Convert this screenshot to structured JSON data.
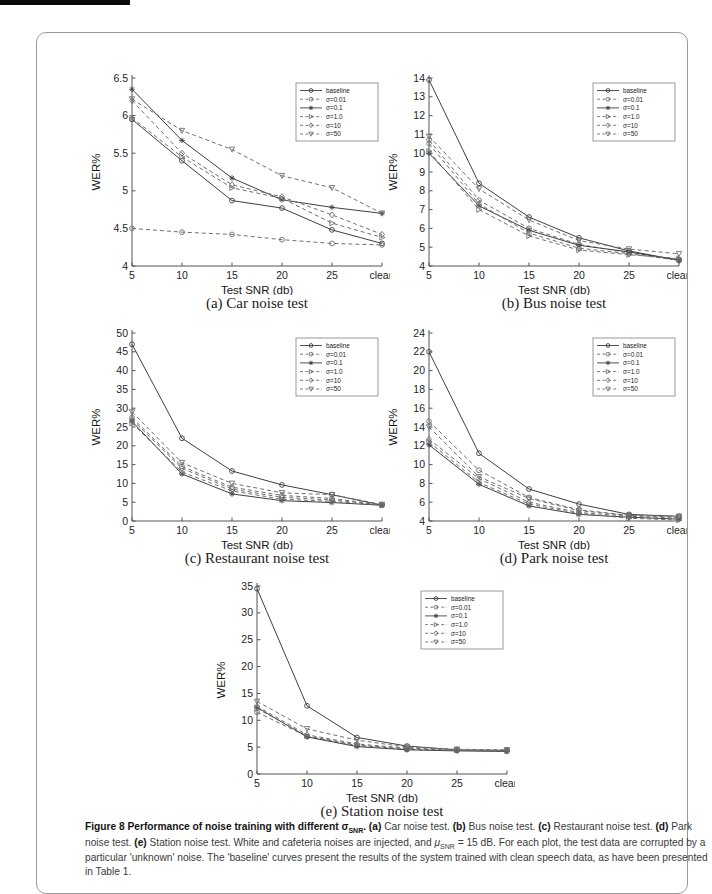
{
  "caption": {
    "segments": [
      {
        "text": "Figure 8 Performance of noise training with different ",
        "bold": true
      },
      {
        "text": "σ",
        "bold": true
      },
      {
        "text": "SNR",
        "bold": true,
        "sub": true
      },
      {
        "text": ". ",
        "bold": true
      },
      {
        "text": "(a)",
        "bold": true
      },
      {
        "text": " Car noise test. "
      },
      {
        "text": "(b)",
        "bold": true
      },
      {
        "text": " Bus noise test. "
      },
      {
        "text": "(c)",
        "bold": true
      },
      {
        "text": " Restaurant noise test. "
      },
      {
        "text": "(d)",
        "bold": true
      },
      {
        "text": " Park noise test. "
      },
      {
        "text": "(e)",
        "bold": true
      },
      {
        "text": " Station noise test. White and cafeteria noises are injected, and "
      },
      {
        "text": "μ",
        "italic": true
      },
      {
        "text": "SNR",
        "sub": true
      },
      {
        "text": " = 15 dB. For each plot, the test data are corrupted by a particular 'unknown' noise. The 'baseline' curves present the results of the system trained with clean speech data, as have been presented in Table 1."
      }
    ]
  },
  "style": {
    "solid_color": "#3f3f3f",
    "dashed_color": "#6f6f6f",
    "axis_color": "#555555",
    "tick_text_color": "#1e1e1e",
    "legend_border_color": "#808080"
  },
  "chart_data": [
    {
      "id": "a",
      "type": "line",
      "caption": "(a) Car noise test",
      "xlabel": "Test SNR (db)",
      "ylabel": "WER%",
      "x_categories": [
        "5",
        "10",
        "15",
        "20",
        "25",
        "clean"
      ],
      "ylim": [
        4,
        6.5
      ],
      "ytick_step": 0.5,
      "grid": false,
      "legend_position": "top-right",
      "series": [
        {
          "name": "baseline",
          "line": "solid",
          "marker": "circle",
          "values": [
            5.95,
            5.4,
            4.87,
            4.77,
            4.48,
            4.3
          ]
        },
        {
          "name": "σ=0.01",
          "line": "dashed",
          "marker": "circle",
          "values": [
            4.5,
            4.45,
            4.42,
            4.35,
            4.3,
            4.28
          ]
        },
        {
          "name": "σ=0.1",
          "line": "solid",
          "marker": "star",
          "values": [
            6.35,
            5.67,
            5.17,
            4.88,
            4.78,
            4.7
          ]
        },
        {
          "name": "σ=1.0",
          "line": "dashed",
          "marker": "tri-right",
          "values": [
            5.97,
            5.45,
            5.04,
            4.9,
            4.57,
            4.38
          ]
        },
        {
          "name": "σ=10",
          "line": "dashed",
          "marker": "diamond",
          "values": [
            6.2,
            5.5,
            5.08,
            4.92,
            4.68,
            4.42
          ]
        },
        {
          "name": "σ=50",
          "line": "dashed",
          "marker": "tri-down",
          "values": [
            6.22,
            5.8,
            5.55,
            5.2,
            5.04,
            4.7
          ]
        }
      ]
    },
    {
      "id": "b",
      "type": "line",
      "caption": "(b) Bus noise test",
      "xlabel": "Test SNR (db)",
      "ylabel": "WER%",
      "x_categories": [
        "5",
        "10",
        "15",
        "20",
        "25",
        "clean"
      ],
      "ylim": [
        4,
        14
      ],
      "ytick_step": 1,
      "grid": false,
      "legend_position": "top-right",
      "series": [
        {
          "name": "baseline",
          "line": "solid",
          "marker": "circle",
          "values": [
            13.9,
            8.4,
            6.6,
            5.5,
            4.8,
            4.3
          ]
        },
        {
          "name": "σ=0.01",
          "line": "dashed",
          "marker": "circle",
          "values": [
            10.7,
            7.5,
            6.0,
            5.15,
            4.7,
            4.35
          ]
        },
        {
          "name": "σ=0.1",
          "line": "solid",
          "marker": "star",
          "values": [
            10.0,
            7.2,
            5.9,
            5.1,
            4.75,
            4.3
          ]
        },
        {
          "name": "σ=1.0",
          "line": "dashed",
          "marker": "tri-right",
          "values": [
            10.1,
            7.0,
            5.6,
            4.85,
            4.6,
            4.4
          ]
        },
        {
          "name": "σ=10",
          "line": "dashed",
          "marker": "diamond",
          "values": [
            10.5,
            7.3,
            5.75,
            4.95,
            4.65,
            4.3
          ]
        },
        {
          "name": "σ=50",
          "line": "dashed",
          "marker": "tri-down",
          "values": [
            10.9,
            8.1,
            6.45,
            5.35,
            4.9,
            4.65
          ]
        }
      ]
    },
    {
      "id": "c",
      "type": "line",
      "caption": "(c) Restaurant noise test",
      "xlabel": "Test SNR (db)",
      "ylabel": "WER%",
      "x_categories": [
        "5",
        "10",
        "15",
        "20",
        "25",
        "clean"
      ],
      "ylim": [
        0,
        50
      ],
      "ytick_step": 5,
      "grid": false,
      "legend_position": "top-right",
      "series": [
        {
          "name": "baseline",
          "line": "solid",
          "marker": "circle",
          "values": [
            47.0,
            22.0,
            13.3,
            9.6,
            7.0,
            4.2
          ]
        },
        {
          "name": "σ=0.01",
          "line": "dashed",
          "marker": "circle",
          "values": [
            27.5,
            14.5,
            9.0,
            6.8,
            6.0,
            4.3
          ]
        },
        {
          "name": "σ=0.1",
          "line": "solid",
          "marker": "star",
          "values": [
            26.5,
            12.5,
            7.2,
            5.4,
            4.9,
            4.2
          ]
        },
        {
          "name": "σ=1.0",
          "line": "dashed",
          "marker": "tri-right",
          "values": [
            26.0,
            13.0,
            8.0,
            5.8,
            5.2,
            4.2
          ]
        },
        {
          "name": "σ=10",
          "line": "dashed",
          "marker": "diamond",
          "values": [
            27.0,
            14.0,
            8.5,
            6.3,
            5.6,
            4.3
          ]
        },
        {
          "name": "σ=50",
          "line": "dashed",
          "marker": "tri-down",
          "values": [
            29.0,
            15.5,
            10.0,
            7.5,
            7.0,
            4.4
          ]
        }
      ]
    },
    {
      "id": "d",
      "type": "line",
      "caption": "(d) Park noise test",
      "xlabel": "Test SNR (db)",
      "ylabel": "WER%",
      "x_categories": [
        "5",
        "10",
        "15",
        "20",
        "25",
        "clean"
      ],
      "ylim": [
        4,
        24
      ],
      "ytick_step": 2,
      "grid": false,
      "legend_position": "top-right",
      "series": [
        {
          "name": "baseline",
          "line": "solid",
          "marker": "circle",
          "values": [
            22.0,
            11.2,
            7.4,
            5.8,
            4.7,
            4.5
          ]
        },
        {
          "name": "σ=0.01",
          "line": "dashed",
          "marker": "circle",
          "values": [
            14.6,
            9.4,
            6.5,
            5.2,
            4.6,
            4.4
          ]
        },
        {
          "name": "σ=0.1",
          "line": "solid",
          "marker": "star",
          "values": [
            12.1,
            7.9,
            5.6,
            4.7,
            4.4,
            4.2
          ]
        },
        {
          "name": "σ=1.0",
          "line": "dashed",
          "marker": "tri-right",
          "values": [
            12.4,
            8.1,
            5.8,
            4.8,
            4.3,
            4.1
          ]
        },
        {
          "name": "σ=10",
          "line": "dashed",
          "marker": "diamond",
          "values": [
            12.7,
            8.5,
            6.0,
            4.9,
            4.5,
            4.3
          ]
        },
        {
          "name": "σ=50",
          "line": "dashed",
          "marker": "tri-down",
          "values": [
            14.0,
            8.7,
            6.4,
            5.1,
            4.6,
            4.5
          ]
        }
      ]
    },
    {
      "id": "e",
      "type": "line",
      "caption": "(e) Station noise test",
      "xlabel": "Test SNR (db)",
      "ylabel": "WER%",
      "x_categories": [
        "5",
        "10",
        "15",
        "20",
        "25",
        "clean"
      ],
      "ylim": [
        0,
        35
      ],
      "ytick_step": 5,
      "grid": false,
      "legend_position": "top-right",
      "series": [
        {
          "name": "baseline",
          "line": "solid",
          "marker": "circle",
          "values": [
            34.5,
            12.7,
            6.8,
            5.2,
            4.5,
            4.4
          ]
        },
        {
          "name": "σ=0.01",
          "line": "dashed",
          "marker": "circle",
          "values": [
            11.5,
            7.0,
            5.3,
            4.6,
            4.4,
            4.3
          ]
        },
        {
          "name": "σ=0.1",
          "line": "solid",
          "marker": "star",
          "values": [
            12.4,
            6.9,
            5.1,
            4.5,
            4.3,
            4.2
          ]
        },
        {
          "name": "σ=1.0",
          "line": "dashed",
          "marker": "tri-right",
          "values": [
            12.2,
            7.1,
            5.4,
            4.7,
            4.4,
            4.3
          ]
        },
        {
          "name": "σ=10",
          "line": "dashed",
          "marker": "diamond",
          "values": [
            12.6,
            7.3,
            5.6,
            4.8,
            4.5,
            4.4
          ]
        },
        {
          "name": "σ=50",
          "line": "dashed",
          "marker": "tri-down",
          "values": [
            13.5,
            8.4,
            6.3,
            5.0,
            4.6,
            4.5
          ]
        }
      ]
    }
  ]
}
